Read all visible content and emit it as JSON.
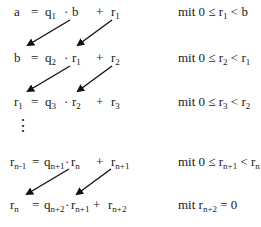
{
  "rows": [
    {
      "lhs": {
        "base": "a",
        "sub": ""
      },
      "q": {
        "base": "q",
        "sub": "1"
      },
      "m": {
        "base": "b",
        "sub": ""
      },
      "r": {
        "base": "r",
        "sub": "1"
      },
      "cond": {
        "prefix": "mit 0 ≤ ",
        "var": "r",
        "sub": "1",
        "rel": " < ",
        "rhs": "b",
        "rhs_sub": ""
      }
    },
    {
      "lhs": {
        "base": "b",
        "sub": ""
      },
      "q": {
        "base": "q",
        "sub": "2"
      },
      "m": {
        "base": "r",
        "sub": "1"
      },
      "r": {
        "base": "r",
        "sub": "2"
      },
      "cond": {
        "prefix": "mit 0 ≤ ",
        "var": "r",
        "sub": "2",
        "rel": " < ",
        "rhs": "r",
        "rhs_sub": "1"
      }
    },
    {
      "lhs": {
        "base": "r",
        "sub": "1"
      },
      "q": {
        "base": "q",
        "sub": "3"
      },
      "m": {
        "base": "r",
        "sub": "2"
      },
      "r": {
        "base": "r",
        "sub": "3"
      },
      "cond": {
        "prefix": "mit 0 ≤ ",
        "var": "r",
        "sub": "3",
        "rel": " < ",
        "rhs": "r",
        "rhs_sub": "2"
      }
    },
    {
      "lhs": {
        "base": "r",
        "sub": "n-1"
      },
      "q": {
        "base": "q",
        "sub": "n+1"
      },
      "m": {
        "base": "r",
        "sub": "n"
      },
      "r": {
        "base": "r",
        "sub": "n+1"
      },
      "cond": {
        "prefix": "mit 0 ≤ ",
        "var": "r",
        "sub": "n+1",
        "rel": " < ",
        "rhs": "r",
        "rhs_sub": "n"
      }
    },
    {
      "lhs": {
        "base": "r",
        "sub": "n"
      },
      "q": {
        "base": "q",
        "sub": "n+2"
      },
      "m": {
        "base": "r",
        "sub": "n+1"
      },
      "r": {
        "base": "r",
        "sub": "n+2"
      },
      "cond": {
        "prefix": "mit  ",
        "var": "r",
        "sub": "n+2",
        "rel": " = ",
        "rhs": "0",
        "rhs_sub": ""
      }
    }
  ],
  "symbols": {
    "eq": "=",
    "dot": "·",
    "plus": "+",
    "vdots": "⋮"
  },
  "colors": {
    "text": "#1a1a1a",
    "arrow": "#111111",
    "background": "#ffffff"
  }
}
